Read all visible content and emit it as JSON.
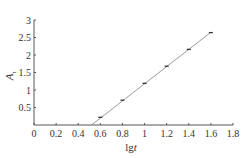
{
  "chart_data": {
    "type": "line",
    "title": "",
    "xlabel": "lgt",
    "ylabel": "A_t",
    "xlim": [
      0,
      1.8
    ],
    "ylim": [
      0,
      3
    ],
    "xticks": [
      0,
      0.2,
      0.4,
      0.6,
      0.8,
      1,
      1.2,
      1.4,
      1.6,
      1.8
    ],
    "yticks": [
      0.5,
      1,
      1.5,
      2,
      2.5,
      3
    ],
    "xtick_labels": [
      "0",
      "0.2",
      "0.4",
      "0.6",
      "0.8",
      "1",
      "1.2",
      "1.4",
      "1.6",
      "1.8"
    ],
    "ytick_labels": [
      "0.5",
      "1",
      "1.5",
      "2",
      "2.5",
      "3"
    ],
    "grid": false,
    "legend": null,
    "series": [
      {
        "name": "measured",
        "marker": "dash",
        "x": [
          0.6,
          0.8,
          1.0,
          1.2,
          1.4,
          1.6
        ],
        "y": [
          0.22,
          0.71,
          1.19,
          1.68,
          2.16,
          2.64
        ]
      },
      {
        "name": "fit",
        "line": true,
        "x": [
          0.52,
          1.6
        ],
        "y": [
          0.0,
          2.65
        ]
      }
    ]
  },
  "labels": {
    "x_title_main": "lg",
    "x_title_italic": "t",
    "y_title_main": "A",
    "y_title_sub": "t"
  }
}
